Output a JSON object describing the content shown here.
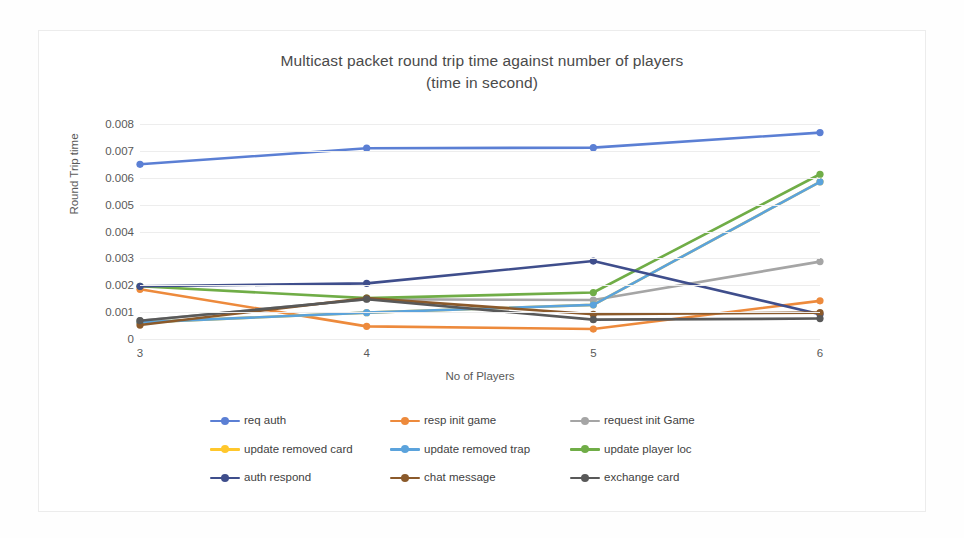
{
  "chart_data": {
    "type": "line",
    "title": "Multicast packet round trip time against number of players",
    "subtitle": "(time in second)",
    "xlabel": "No of Players",
    "ylabel": "Round Trip time",
    "categories": [
      "3",
      "4",
      "5",
      "6"
    ],
    "x": [
      3,
      4,
      5,
      6
    ],
    "ylim": [
      0,
      0.008
    ],
    "ytick_labels": [
      "0.008",
      "0.007",
      "0.006",
      "0.005",
      "0.004",
      "0.003",
      "0.002",
      "0.001",
      "0"
    ],
    "ytick_values": [
      0.008,
      0.007,
      0.006,
      0.005,
      0.004,
      0.003,
      0.002,
      0.001,
      0
    ],
    "grid": true,
    "legend_position": "bottom",
    "series": [
      {
        "name": "req auth",
        "color": "#5B7FD4",
        "values": [
          0.0065,
          0.0071,
          0.00712,
          0.00768
        ]
      },
      {
        "name": "resp init game",
        "color": "#ED8A3C",
        "values": [
          0.00185,
          0.00047,
          0.00037,
          0.00142
        ]
      },
      {
        "name": "request init Game",
        "color": "#A5A5A5",
        "values": [
          0.00068,
          0.00148,
          0.00145,
          0.00288
        ]
      },
      {
        "name": "update removed card",
        "color": "#FFC72C",
        "values": [
          0.00062,
          0.00098,
          0.00127,
          0.00585
        ]
      },
      {
        "name": "update removed trap",
        "color": "#5BA3DC",
        "values": [
          0.00062,
          0.00098,
          0.00127,
          0.00585
        ]
      },
      {
        "name": "update player loc",
        "color": "#70AD47",
        "values": [
          0.00196,
          0.00152,
          0.00173,
          0.00613
        ]
      },
      {
        "name": "auth respond",
        "color": "#3F4E8C",
        "values": [
          0.00196,
          0.00207,
          0.0029,
          0.00092
        ]
      },
      {
        "name": "chat message",
        "color": "#8B5A2B",
        "values": [
          0.00052,
          0.00152,
          0.00092,
          0.00098
        ]
      },
      {
        "name": "exchange card",
        "color": "#595959",
        "values": [
          0.00068,
          0.00148,
          0.00072,
          0.00076
        ]
      }
    ]
  }
}
